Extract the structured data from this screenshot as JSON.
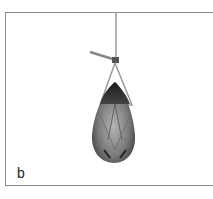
{
  "figure": {
    "panel_label": "b",
    "colors": {
      "border": "#8a8a8a",
      "wire": "#9a9a9a",
      "crystal_dark": "#2a2a2a",
      "crystal_mid": "#6e6e6e",
      "crystal_light": "#b5b5b5"
    }
  }
}
